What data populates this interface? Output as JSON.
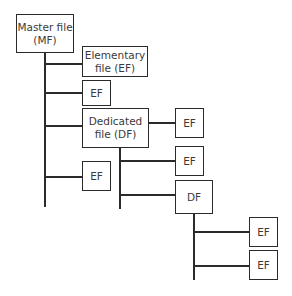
{
  "diagram": {
    "type": "file-hierarchy-tree",
    "nodes": {
      "mf": {
        "line1": "Master file",
        "line2": "(MF)"
      },
      "ef_elementary": {
        "line1": "Elementary",
        "line2": "file (EF)"
      },
      "ef_1": {
        "label": "EF"
      },
      "df_dedicated": {
        "line1": "Dedicated",
        "line2": "file (DF)"
      },
      "ef_under_mf": {
        "label": "EF"
      },
      "ef_df_right": {
        "label": "EF"
      },
      "ef_df_child": {
        "label": "EF"
      },
      "df_child": {
        "label": "DF"
      },
      "ef_df2_a": {
        "label": "EF"
      },
      "ef_df2_b": {
        "label": "EF"
      }
    },
    "edges": [
      [
        "mf",
        "ef_elementary"
      ],
      [
        "mf",
        "ef_1"
      ],
      [
        "mf",
        "df_dedicated"
      ],
      [
        "mf",
        "ef_under_mf"
      ],
      [
        "df_dedicated",
        "ef_df_right"
      ],
      [
        "df_dedicated",
        "ef_df_child"
      ],
      [
        "df_dedicated",
        "df_child"
      ],
      [
        "df_child",
        "ef_df2_a"
      ],
      [
        "df_child",
        "ef_df2_b"
      ]
    ]
  }
}
